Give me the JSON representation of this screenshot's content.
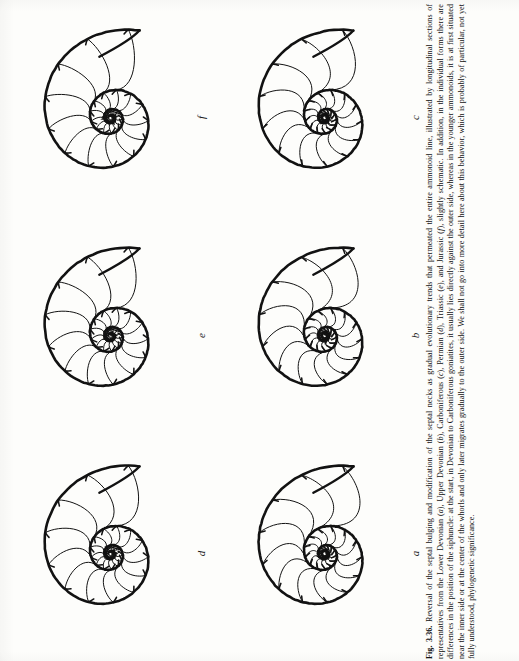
{
  "figure": {
    "number": "Fig. 3.36.",
    "caption_text": "Reversal of the septal bulging and modification of the septal necks as gradual evolutionary trends that permeated the entire ammonoid line, illustrated by longitudinal sections of representatives from the Lower Devonian (a), Upper Devonian (b), Carboniferous (c), Permian (d), Triassic (e), and Jurassic (f), slightly schematic. In addition, in the individual forms there are differences in the position of the siphuncle: at the start, in Devonian to Carboniferous goniatites, it usually lies directly against the outer side, whereas in the younger ammonoids, it is at first situated near the inner side or at the center of the whorls and only later migrates gradually to the outer side. We shall not go into more detail here about this behavior, which is probably of particular, not yet fully understood, phylogenetic significance.",
    "caption_parts": [
      {
        "type": "bold",
        "text": "Fig. 3.36."
      },
      {
        "type": "plain",
        "text": " Reversal of the septal bulging and modification of the septal necks as gradual evolutionary trends that permeated the entire ammonoid line, illustrated by longitudinal sections of representatives from the Lower Devonian ("
      },
      {
        "type": "italic",
        "text": "a"
      },
      {
        "type": "plain",
        "text": "), Upper Devonian ("
      },
      {
        "type": "italic",
        "text": "b"
      },
      {
        "type": "plain",
        "text": "), Carboniferous ("
      },
      {
        "type": "italic",
        "text": "c"
      },
      {
        "type": "plain",
        "text": "), Permian ("
      },
      {
        "type": "italic",
        "text": "d"
      },
      {
        "type": "plain",
        "text": "), Triassic ("
      },
      {
        "type": "italic",
        "text": "e"
      },
      {
        "type": "plain",
        "text": "), and Jurassic ("
      },
      {
        "type": "italic",
        "text": "f"
      },
      {
        "type": "plain",
        "text": "), slightly schematic. In addition, in the individual forms there are differences in the position of the siphuncle: at the start, in Devonian to Carboniferous goniatites, it usually lies directly against the outer side, whereas in the younger ammonoids, it is at first situated near the inner side or at the center of the whorls and only later migrates gradually to the outer side. We shall not go into more detail here about this behavior, which is probably of particular, not yet fully understood, phylogenetic significance."
      }
    ]
  },
  "panels": [
    {
      "id": "f",
      "label": "f",
      "period": "Jurassic",
      "row": 0,
      "col": 0,
      "seed": 6,
      "septa": 13,
      "whorls": 3.05,
      "inner_rings": 5,
      "bulge": -1.0
    },
    {
      "id": "c",
      "label": "c",
      "period": "Carboniferous",
      "row": 0,
      "col": 1,
      "seed": 3,
      "septa": 13,
      "whorls": 3.05,
      "inner_rings": 5,
      "bulge": 0.25
    },
    {
      "id": "e",
      "label": "e",
      "period": "Triassic",
      "row": 1,
      "col": 0,
      "seed": 5,
      "septa": 13,
      "whorls": 3.05,
      "inner_rings": 5,
      "bulge": -0.7
    },
    {
      "id": "b",
      "label": "b",
      "period": "Upper Devonian",
      "row": 1,
      "col": 1,
      "seed": 2,
      "septa": 13,
      "whorls": 3.05,
      "inner_rings": 5,
      "bulge": 0.7
    },
    {
      "id": "d",
      "label": "d",
      "period": "Permian",
      "row": 2,
      "col": 0,
      "seed": 4,
      "septa": 13,
      "whorls": 3.05,
      "inner_rings": 5,
      "bulge": -0.25
    },
    {
      "id": "a",
      "label": "a",
      "period": "Lower Devonian",
      "row": 2,
      "col": 1,
      "seed": 1,
      "septa": 13,
      "whorls": 3.05,
      "inner_rings": 5,
      "bulge": 1.0
    }
  ],
  "style": {
    "ink": "#121212",
    "paper": "#fdfdfb",
    "outer_stroke": 2.6,
    "septum_stroke": 1.0
  }
}
